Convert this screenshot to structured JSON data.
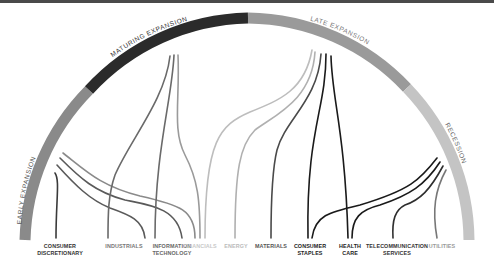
{
  "phases": [
    {
      "label": "EARLY EXPANSION",
      "color": "#8a8a8a"
    },
    {
      "label": "MATURING EXPANSION",
      "color": "#2b2b2b"
    },
    {
      "label": "LATE EXPANSION",
      "color": "#9a9a9a"
    },
    {
      "label": "RECESSION",
      "color": "#c4c4c4"
    }
  ],
  "sectors": [
    {
      "label_line1": "CONSUMER",
      "label_line2": "DISCRETIONARY",
      "color": "#2e2e2e"
    },
    {
      "label_line1": "INDUSTRIALS",
      "label_line2": "",
      "color": "#6a6a6a"
    },
    {
      "label_line1": "INFORMATION",
      "label_line2": "TECHNOLOGY",
      "color": "#6a6a6a"
    },
    {
      "label_line1": "FINANCIALS",
      "label_line2": "",
      "color": "#c4c4c4"
    },
    {
      "label_line1": "ENERGY",
      "label_line2": "",
      "color": "#b0b0b0"
    },
    {
      "label_line1": "MATERIALS",
      "label_line2": "",
      "color": "#4a4a4a"
    },
    {
      "label_line1": "CONSUMER",
      "label_line2": "STAPLES",
      "color": "#1a1a1a"
    },
    {
      "label_line1": "HEALTH",
      "label_line2": "CARE",
      "color": "#1a1a1a"
    },
    {
      "label_line1": "TELECOMMUNICATION",
      "label_line2": "SERVICES",
      "color": "#2e2e2e"
    },
    {
      "label_line1": "UTILITIES",
      "label_line2": "",
      "color": "#9a9a9a"
    }
  ]
}
